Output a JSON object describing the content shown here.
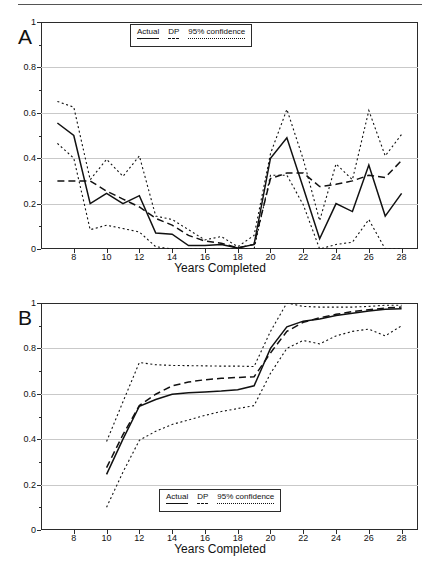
{
  "figure": {
    "panels": [
      {
        "id": "A",
        "letter": "A"
      },
      {
        "id": "B",
        "letter": "B"
      }
    ],
    "xlabel": "Years Completed",
    "legend": {
      "items": [
        {
          "label": "Actual",
          "style": "solid"
        },
        {
          "label": "DP",
          "style": "dashed"
        },
        {
          "label": "95% confidence",
          "style": "dotted"
        }
      ]
    }
  },
  "chart_data": [
    {
      "id": "A",
      "type": "line",
      "title": "",
      "panel_label": "A",
      "xlabel": "Years Completed",
      "ylabel": "",
      "xlim": [
        6,
        29
      ],
      "ylim": [
        0,
        1
      ],
      "xticks": [
        8,
        10,
        12,
        14,
        16,
        18,
        20,
        22,
        24,
        26,
        28
      ],
      "yticks": [
        0,
        0.2,
        0.4,
        0.6,
        0.8,
        1
      ],
      "ytick_labels": [
        "0",
        "0.2",
        "0.4",
        "0.6",
        "0.8",
        "1"
      ],
      "grid": "horizontal",
      "legend_position": "top-center",
      "x": [
        7,
        8,
        9,
        10,
        11,
        12,
        13,
        14,
        15,
        16,
        17,
        18,
        19,
        20,
        21,
        22,
        23,
        24,
        25,
        26,
        27,
        28
      ],
      "series": [
        {
          "name": "Actual",
          "style": "solid",
          "values": [
            0.555,
            0.5,
            0.2,
            0.245,
            0.2,
            0.235,
            0.07,
            0.065,
            0.015,
            0.015,
            0.02,
            0.005,
            0.02,
            0.4,
            0.49,
            0.27,
            0.045,
            0.2,
            0.165,
            0.37,
            0.145,
            0.245
          ]
        },
        {
          "name": "DP",
          "style": "dashed",
          "values": [
            0.3,
            0.3,
            0.3,
            0.255,
            0.22,
            0.185,
            0.135,
            0.105,
            0.06,
            0.035,
            0.025,
            0.005,
            0.02,
            0.31,
            0.335,
            0.335,
            0.275,
            0.285,
            0.3,
            0.325,
            0.315,
            0.39
          ]
        },
        {
          "name": "95% confidence upper",
          "style": "dotted",
          "values": [
            0.65,
            0.625,
            0.305,
            0.395,
            0.32,
            0.41,
            0.145,
            0.13,
            0.085,
            0.04,
            0.055,
            0.01,
            0.06,
            0.42,
            0.615,
            0.395,
            0.125,
            0.375,
            0.305,
            0.61,
            0.41,
            0.505
          ]
        },
        {
          "name": "95% confidence lower",
          "style": "dotted",
          "values": [
            0.465,
            0.4,
            0.085,
            0.105,
            0.09,
            0.075,
            0.01,
            0.0,
            0.0,
            0.0,
            0.0,
            0.0,
            0.0,
            0.325,
            0.325,
            0.195,
            0.0,
            0.02,
            0.03,
            0.13,
            0.0,
            0.0
          ]
        }
      ]
    },
    {
      "id": "B",
      "type": "line",
      "title": "",
      "panel_label": "B",
      "xlabel": "Years Completed",
      "ylabel": "",
      "xlim": [
        6,
        29
      ],
      "ylim": [
        0,
        1
      ],
      "xticks": [
        8,
        10,
        12,
        14,
        16,
        18,
        20,
        22,
        24,
        26,
        28
      ],
      "yticks": [
        0,
        0.2,
        0.4,
        0.6,
        0.8,
        1
      ],
      "ytick_labels": [
        "0",
        "0.2",
        "0.4",
        "0.6",
        "0.8",
        "1"
      ],
      "grid": "horizontal",
      "legend_position": "bottom-center",
      "x": [
        10,
        11,
        12,
        13,
        14,
        15,
        16,
        17,
        18,
        19,
        20,
        21,
        22,
        23,
        24,
        25,
        26,
        27,
        28
      ],
      "series": [
        {
          "name": "Actual",
          "style": "solid",
          "values": [
            0.245,
            0.4,
            0.545,
            0.575,
            0.598,
            0.605,
            0.608,
            0.612,
            0.618,
            0.635,
            0.8,
            0.895,
            0.92,
            0.93,
            0.945,
            0.955,
            0.965,
            0.972,
            0.975
          ]
        },
        {
          "name": "DP",
          "style": "dashed",
          "values": [
            0.275,
            0.42,
            0.548,
            0.598,
            0.635,
            0.652,
            0.662,
            0.668,
            0.672,
            0.675,
            0.78,
            0.875,
            0.915,
            0.935,
            0.95,
            0.962,
            0.97,
            0.978,
            0.982
          ]
        },
        {
          "name": "95% confidence upper",
          "style": "dotted",
          "values": [
            0.39,
            0.565,
            0.738,
            0.728,
            0.725,
            0.724,
            0.723,
            0.722,
            0.722,
            0.72,
            0.875,
            1.0,
            0.985,
            0.982,
            0.982,
            0.982,
            0.985,
            0.99,
            0.99
          ]
        },
        {
          "name": "95% confidence lower",
          "style": "dotted",
          "values": [
            0.1,
            0.255,
            0.395,
            0.435,
            0.465,
            0.485,
            0.505,
            0.522,
            0.535,
            0.548,
            0.69,
            0.8,
            0.835,
            0.82,
            0.855,
            0.875,
            0.885,
            0.855,
            0.9
          ]
        }
      ]
    }
  ]
}
